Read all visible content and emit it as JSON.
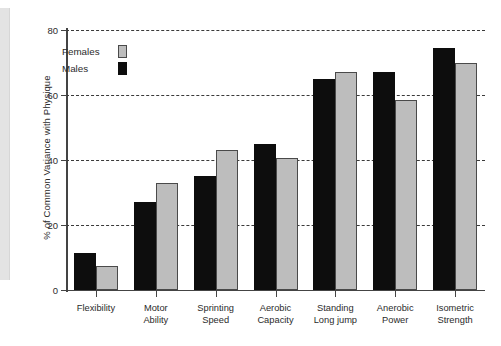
{
  "chart_data": {
    "type": "bar",
    "title": "",
    "subtitle": "",
    "xlabel": "",
    "ylabel": "% of Common Variance with Physique",
    "ylim": [
      0,
      80
    ],
    "yticks": [
      0,
      20,
      40,
      60,
      80
    ],
    "ytick_labels": [
      "0",
      "20",
      "40",
      "60",
      "80"
    ],
    "grid": "horizontal-dashed",
    "legend_position": "inside-top-left",
    "categories": [
      "Flexibility",
      "Motor Ability",
      "Sprinting Speed",
      "Aerobic Capacity",
      "Standing Long jump",
      "Anerobic Power",
      "Isometric Strength"
    ],
    "category_lines": [
      [
        "Flexibility"
      ],
      [
        "Motor",
        "Ability"
      ],
      [
        "Sprinting",
        "Speed"
      ],
      [
        "Aerobic",
        "Capacity"
      ],
      [
        "Standing",
        "Long jump"
      ],
      [
        "Anerobic",
        "Power"
      ],
      [
        "Isometric",
        "Strength"
      ]
    ],
    "series": [
      {
        "name": "Males",
        "color": "#0d0d0d",
        "values": [
          11.5,
          27,
          35,
          45,
          65,
          67,
          74.5
        ]
      },
      {
        "name": "Females",
        "color": "#bdbdbd",
        "values": [
          7.5,
          33,
          43,
          40.5,
          67,
          58.5,
          70
        ]
      }
    ]
  },
  "legend": {
    "entries": [
      {
        "label": "Females",
        "swatch": "female"
      },
      {
        "label": "Males",
        "swatch": "male"
      }
    ]
  }
}
